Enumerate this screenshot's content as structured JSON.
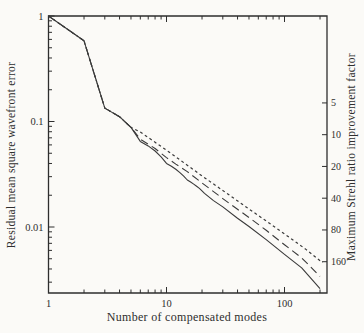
{
  "figure": {
    "background": "#fbfaf7",
    "ink": "#2e2e2e",
    "line_color": "#3a3a3a"
  },
  "chart_data": {
    "type": "line",
    "title": "",
    "xlabel": "Number of compensated modes",
    "ylabel": "Residual mean square wavefront error",
    "ylabel_right": "Maximum Strehl ratio improvement factor",
    "x_scale": "log",
    "y_scale": "log",
    "xlim": [
      1,
      229
    ],
    "ylim": [
      0.0024,
      1.0
    ],
    "grid": false,
    "legend": null,
    "x_ticks": {
      "major": [
        1,
        10,
        100
      ],
      "labels": [
        "1",
        "10",
        "100"
      ],
      "minor": [
        2,
        3,
        4,
        5,
        6,
        7,
        8,
        9,
        20,
        30,
        40,
        50,
        60,
        70,
        80,
        90,
        200
      ]
    },
    "y_ticks": {
      "major": [
        1,
        0.1,
        0.01
      ],
      "labels": [
        "1",
        "0.1",
        "0.01"
      ],
      "minor": [
        0.9,
        0.8,
        0.7,
        0.6,
        0.5,
        0.4,
        0.3,
        0.2,
        0.09,
        0.08,
        0.07,
        0.06,
        0.05,
        0.04,
        0.03,
        0.02,
        0.009,
        0.008,
        0.007,
        0.006,
        0.005,
        0.004,
        0.003
      ]
    },
    "right_ticks": {
      "values": [
        5,
        10,
        20,
        40,
        80,
        160
      ],
      "labels": [
        "5",
        "10",
        "20",
        "40",
        "80",
        "160"
      ],
      "strehl_error_product": 0.75
    },
    "series": [
      {
        "name": "modal-compensation-solid",
        "style": "solid",
        "points": [
          [
            1,
            1.0
          ],
          [
            2,
            0.582
          ],
          [
            3,
            0.134
          ],
          [
            4,
            0.111
          ],
          [
            5,
            0.088
          ],
          [
            6,
            0.0648
          ],
          [
            7,
            0.0587
          ],
          [
            8,
            0.0525
          ],
          [
            9,
            0.0463
          ],
          [
            10,
            0.0401
          ],
          [
            11,
            0.0377
          ],
          [
            12,
            0.0352
          ],
          [
            13,
            0.0328
          ],
          [
            14,
            0.0304
          ],
          [
            15,
            0.0279
          ],
          [
            16,
            0.0267
          ],
          [
            17,
            0.0255
          ],
          [
            18,
            0.0243
          ],
          [
            19,
            0.0232
          ],
          [
            20,
            0.022
          ],
          [
            21,
            0.0208
          ],
          [
            25,
            0.0178
          ],
          [
            30,
            0.0155
          ],
          [
            40,
            0.0121
          ],
          [
            50,
            0.0101
          ],
          [
            70,
            0.0076
          ],
          [
            100,
            0.0055
          ],
          [
            140,
            0.0041
          ],
          [
            200,
            0.0026
          ]
        ]
      },
      {
        "name": "modal-compensation-long-dash",
        "style": "dashed",
        "points": [
          [
            1,
            1.0
          ],
          [
            2,
            0.582
          ],
          [
            3,
            0.134
          ],
          [
            4,
            0.111
          ],
          [
            5,
            0.088
          ],
          [
            6,
            0.068
          ],
          [
            8,
            0.0555
          ],
          [
            10,
            0.0455
          ],
          [
            12,
            0.0395
          ],
          [
            15,
            0.0335
          ],
          [
            20,
            0.0262
          ],
          [
            30,
            0.0186
          ],
          [
            40,
            0.0147
          ],
          [
            50,
            0.0123
          ],
          [
            70,
            0.0093
          ],
          [
            100,
            0.0068
          ],
          [
            140,
            0.0051
          ],
          [
            200,
            0.0034
          ]
        ]
      },
      {
        "name": "modal-compensation-short-dash",
        "style": "dotted",
        "points": [
          [
            1,
            1.0
          ],
          [
            2,
            0.582
          ],
          [
            3,
            0.134
          ],
          [
            4,
            0.111
          ],
          [
            5,
            0.088
          ],
          [
            6,
            0.0795
          ],
          [
            8,
            0.0635
          ],
          [
            10,
            0.0535
          ],
          [
            15,
            0.0385
          ],
          [
            20,
            0.0305
          ],
          [
            30,
            0.0222
          ],
          [
            50,
            0.0148
          ],
          [
            70,
            0.0114
          ],
          [
            100,
            0.0086
          ],
          [
            150,
            0.0062
          ],
          [
            210,
            0.0046
          ]
        ]
      }
    ]
  }
}
